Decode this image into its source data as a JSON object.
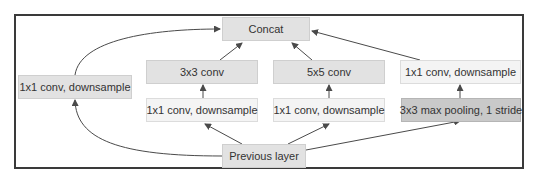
{
  "diagram": {
    "type": "inception-module",
    "nodes": {
      "concat": {
        "label": "Concat"
      },
      "conv3x3": {
        "label": "3x3 conv"
      },
      "conv5x5": {
        "label": "5x5 conv"
      },
      "right_downsample": {
        "label": "1x1 conv, downsample"
      },
      "left_downsample": {
        "label": "1x1 conv, downsample"
      },
      "downsample_a": {
        "label": "1x1 conv, downsample"
      },
      "downsample_b": {
        "label": "1x1 conv, downsample"
      },
      "maxpool": {
        "label": "3x3 max pooling, 1 stride"
      },
      "previous": {
        "label": "Previous layer"
      }
    },
    "edges": [
      {
        "from": "previous",
        "to": "left_downsample"
      },
      {
        "from": "previous",
        "to": "downsample_a"
      },
      {
        "from": "previous",
        "to": "downsample_b"
      },
      {
        "from": "previous",
        "to": "maxpool"
      },
      {
        "from": "downsample_a",
        "to": "conv3x3"
      },
      {
        "from": "downsample_b",
        "to": "conv5x5"
      },
      {
        "from": "maxpool",
        "to": "right_downsample"
      },
      {
        "from": "left_downsample",
        "to": "concat"
      },
      {
        "from": "conv3x3",
        "to": "concat"
      },
      {
        "from": "conv5x5",
        "to": "concat"
      },
      {
        "from": "right_downsample",
        "to": "concat"
      }
    ],
    "colors": {
      "node_mid": "#e2e2e2",
      "node_light": "#f4f4f4",
      "node_dark": "#c9c9c9",
      "edge": "#4a4a4a",
      "frame": "#3a3a3a"
    }
  }
}
